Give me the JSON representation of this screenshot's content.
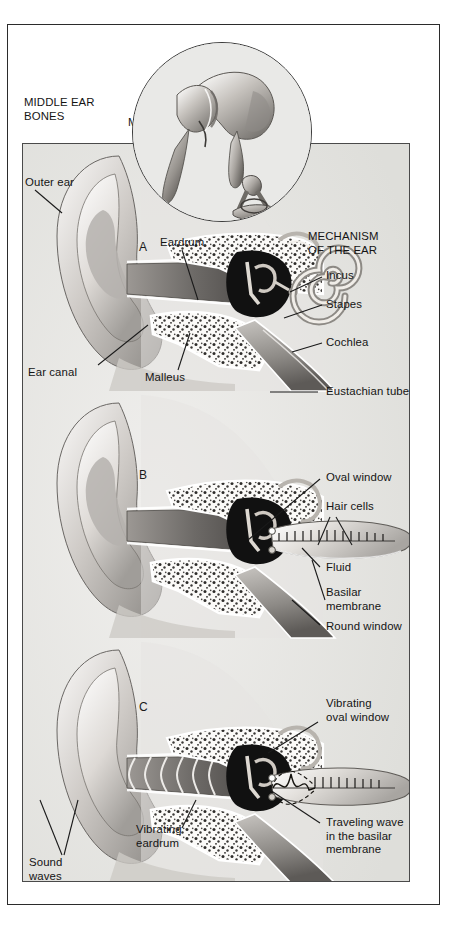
{
  "figure": {
    "title_left": "MIDDLE EAR\nBONES",
    "title_right": "MECHANISM\nOF THE EAR"
  },
  "inset": {
    "name": "middle-ear-bones-inset",
    "labels": [
      {
        "id": "malleus",
        "text": "Malleus"
      },
      {
        "id": "incus",
        "text": "Incus"
      },
      {
        "id": "stapes",
        "text": "Stapes"
      }
    ]
  },
  "panels": [
    {
      "id": "panel-a",
      "marker": "A",
      "labels": [
        {
          "id": "outer-ear",
          "text": "Outer ear"
        },
        {
          "id": "ear-canal",
          "text": "Ear canal"
        },
        {
          "id": "eardrum",
          "text": "Eardrum"
        },
        {
          "id": "malleus",
          "text": "Malleus"
        },
        {
          "id": "incus",
          "text": "Incus"
        },
        {
          "id": "stapes",
          "text": "Stapes"
        },
        {
          "id": "cochlea",
          "text": "Cochlea"
        },
        {
          "id": "eustachian-tube",
          "text": "Eustachian tube"
        }
      ]
    },
    {
      "id": "panel-b",
      "marker": "B",
      "labels": [
        {
          "id": "oval-window",
          "text": "Oval window"
        },
        {
          "id": "hair-cells",
          "text": "Hair cells"
        },
        {
          "id": "fluid",
          "text": "Fluid"
        },
        {
          "id": "basilar-membrane",
          "text": "Basilar\nmembrane"
        },
        {
          "id": "round-window",
          "text": "Round window"
        }
      ]
    },
    {
      "id": "panel-c",
      "marker": "C",
      "labels": [
        {
          "id": "vibrating-oval-window",
          "text": "Vibrating\noval window"
        },
        {
          "id": "vibrating-eardrum",
          "text": "Vibrating\neardrum"
        },
        {
          "id": "sound-waves",
          "text": "Sound\nwaves"
        },
        {
          "id": "traveling-wave",
          "text": "Traveling wave\nin the basilar\nmembrane"
        }
      ]
    }
  ],
  "colors": {
    "background": "#ffffff",
    "panel_fill": "#e8e8e6",
    "frame_stroke": "#2b2b2b",
    "panel_stroke": "#4a4a4a",
    "text": "#141414",
    "tissue_light": "#f2f0ee",
    "tissue_mid": "#b9b6b2",
    "tissue_dark": "#6e6b68",
    "cavity_black": "#121212"
  }
}
